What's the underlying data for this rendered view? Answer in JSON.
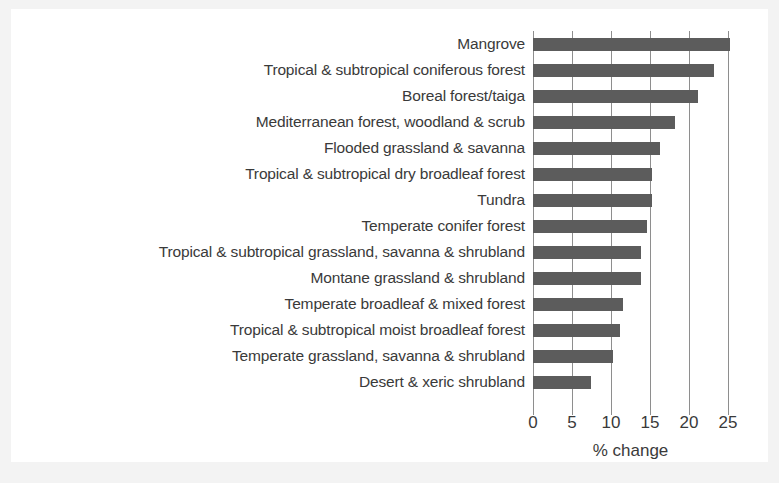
{
  "chart_data": {
    "type": "bar",
    "orientation": "horizontal",
    "title": "",
    "xlabel": "% change",
    "ylabel": "",
    "xlim": [
      0,
      26.5
    ],
    "xticks": [
      "0",
      "5",
      "10",
      "15",
      "20",
      "25"
    ],
    "xtick_values": [
      0,
      5,
      10,
      15,
      20,
      25
    ],
    "grid": "vertical",
    "legend": "none",
    "bar_color": "#5c5c5c",
    "background_color": "#ffffff",
    "categories": [
      "Mangrove",
      "Tropical & subtropical coniferous forest",
      "Boreal forest/taiga",
      "Mediterranean forest, woodland & scrub",
      "Flooded grassland & savanna",
      "Tropical & subtropical dry broadleaf forest",
      "Tundra",
      "Temperate conifer forest",
      "Tropical & subtropical grassland, savanna & shrubland",
      "Montane grassland & shrubland",
      "Temperate broadleaf & mixed forest",
      "Tropical & subtropical moist broadleaf forest",
      "Temperate grassland, savanna & shrubland",
      "Desert & xeric shrubland"
    ],
    "values": [
      25.3,
      23.2,
      21.1,
      18.2,
      16.3,
      15.3,
      15.2,
      14.6,
      13.9,
      13.8,
      11.5,
      11.1,
      10.3,
      7.4
    ]
  }
}
